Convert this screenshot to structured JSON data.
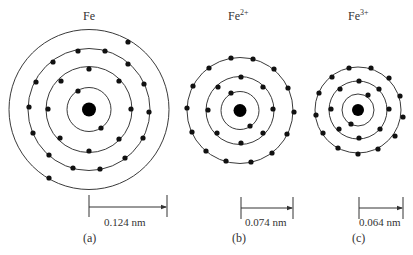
{
  "atoms": [
    {
      "id": "fe",
      "label": "Fe",
      "charge": "",
      "panel": "(a)",
      "radius_label": "0.124 nm",
      "center": [
        89,
        109.5
      ],
      "nucleus_r": 7,
      "label_pos": [
        83,
        20
      ],
      "shells": [
        {
          "r": 22,
          "electron_count": 2,
          "electrons": [
            [
              78,
              91
            ],
            [
              101,
              128
            ]
          ]
        },
        {
          "r": 43,
          "electron_count": 8,
          "electrons": [
            [
              89,
              69
            ],
            [
              119,
              81
            ],
            [
              131,
              109
            ],
            [
              119,
              139
            ],
            [
              89,
              151
            ],
            [
              60,
              138
            ],
            [
              48,
              109
            ],
            [
              61,
              81
            ]
          ]
        },
        {
          "r": 61,
          "electron_count": 14,
          "electrons": [
            [
              78,
              51
            ],
            [
              105,
              51
            ],
            [
              53,
              62
            ],
            [
              128,
              64
            ],
            [
              36,
              82
            ],
            [
              144,
              84
            ],
            [
              29,
              107
            ],
            [
              149,
              112
            ],
            [
              33,
              133
            ],
            [
              143,
              138
            ],
            [
              49,
              155
            ],
            [
              125,
              158
            ],
            [
              73,
              168
            ],
            [
              100,
              169
            ]
          ]
        },
        {
          "r": 80,
          "electron_count": 2,
          "electrons": [
            [
              128,
              42
            ],
            [
              49,
              178
            ]
          ]
        }
      ],
      "scale_bar": {
        "x1": 89,
        "x2": 167,
        "y": 207,
        "tick_top": 195,
        "tick_bottom": 217,
        "text_x": 104,
        "text_y": 226
      },
      "panel_pos": [
        83,
        242
      ]
    },
    {
      "id": "fe2",
      "label": "Fe",
      "charge": "2+",
      "panel": "(b)",
      "radius_label": "0.074 nm",
      "center": [
        240,
        110.5
      ],
      "nucleus_r": 6.5,
      "label_pos": [
        228,
        20
      ],
      "shells": [
        {
          "r": 19,
          "electron_count": 2,
          "electrons": [
            [
              231,
              93
            ],
            [
              250,
              126
            ]
          ]
        },
        {
          "r": 34,
          "electron_count": 8,
          "electrons": [
            [
              241,
              77
            ],
            [
              263,
              87
            ],
            [
              273,
              109
            ],
            [
              263,
              133
            ],
            [
              241,
              143
            ],
            [
              217,
              133
            ],
            [
              208,
              110
            ],
            [
              218,
              87
            ]
          ]
        },
        {
          "r": 53,
          "electron_count": 14,
          "electrons": [
            [
              231,
              58
            ],
            [
              253,
              59
            ],
            [
              209,
              68
            ],
            [
              274,
              69
            ],
            [
              193,
              86
            ],
            [
              288,
              88
            ],
            [
              187,
              108
            ],
            [
              294,
              112
            ],
            [
              192,
              132
            ],
            [
              287,
              134
            ],
            [
              206,
              151
            ],
            [
              272,
              153
            ],
            [
              226,
              161
            ],
            [
              251,
              162
            ]
          ]
        }
      ],
      "scale_bar": {
        "x1": 241,
        "x2": 293,
        "y": 208,
        "tick_top": 197,
        "tick_bottom": 219,
        "text_x": 245,
        "text_y": 226
      },
      "panel_pos": [
        232,
        242
      ]
    },
    {
      "id": "fe3",
      "label": "Fe",
      "charge": "3+",
      "panel": "(c)",
      "radius_label": "0.064 nm",
      "center": [
        358,
        110
      ],
      "nucleus_r": 6,
      "label_pos": [
        348,
        20
      ],
      "shells": [
        {
          "r": 16,
          "electron_count": 2,
          "electrons": [
            [
              368,
              95
            ],
            [
              351,
              124
            ]
          ]
        },
        {
          "r": 29,
          "electron_count": 8,
          "electrons": [
            [
              359,
              81
            ],
            [
              379,
              89
            ],
            [
              389,
              109
            ],
            [
              380,
              129
            ],
            [
              359,
              138
            ],
            [
              339,
              129
            ],
            [
              331,
              109
            ],
            [
              340,
              89
            ]
          ]
        },
        {
          "r": 43,
          "electron_count": 13,
          "electrons": [
            [
              349,
              68
            ],
            [
              371,
              68
            ],
            [
              332,
              77
            ],
            [
              389,
              78
            ],
            [
              319,
              93
            ],
            [
              400,
              96
            ],
            [
              316,
              115
            ],
            [
              403,
              117
            ],
            [
              323,
              133
            ],
            [
              395,
              136
            ],
            [
              338,
              148
            ],
            [
              378,
              149
            ],
            [
              358,
              154
            ]
          ]
        }
      ],
      "scale_bar": {
        "x1": 359,
        "x2": 403,
        "y": 208,
        "tick_top": 197,
        "tick_bottom": 219,
        "text_x": 359,
        "text_y": 226
      },
      "panel_pos": [
        352,
        242
      ]
    }
  ],
  "colors": {
    "background": "#ffffff",
    "ink": "#111111",
    "text": "#333333"
  }
}
